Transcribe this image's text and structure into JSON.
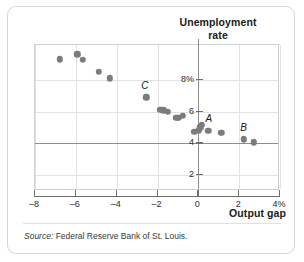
{
  "figure": {
    "source_prefix": "Source:",
    "source_text": " Federal Reserve Bank of St. Louis."
  },
  "chart_data": {
    "type": "scatter",
    "title": "Unemployment rate",
    "title_line1": "Unemployment",
    "title_line2": "rate",
    "xlabel": "Output gap",
    "ylabel": "Unemployment rate",
    "xlim": [
      -8,
      4
    ],
    "ylim": [
      1,
      10.2
    ],
    "xticks": [
      -8,
      -6,
      -4,
      -2,
      0,
      2,
      4
    ],
    "xticklabels": [
      "–8",
      "–6",
      "–4",
      "–2",
      "0",
      "2",
      "4%"
    ],
    "yticks": [
      8,
      6,
      4,
      2
    ],
    "yticklabels": [
      "8%",
      "6",
      "4",
      "2"
    ],
    "grid": true,
    "legend": null,
    "marker_color": "#7c7c7c",
    "points": [
      {
        "x": -6.8,
        "y": 9.3,
        "label": ""
      },
      {
        "x": -5.92,
        "y": 9.62,
        "label": ""
      },
      {
        "x": -5.66,
        "y": 9.26,
        "label": ""
      },
      {
        "x": -4.88,
        "y": 8.52,
        "label": ""
      },
      {
        "x": -4.33,
        "y": 8.1,
        "label": ""
      },
      {
        "x": -2.54,
        "y": 6.9,
        "label": "C"
      },
      {
        "x": -1.86,
        "y": 6.12,
        "label": ""
      },
      {
        "x": -1.72,
        "y": 6.08,
        "label": ""
      },
      {
        "x": -1.5,
        "y": 6.0,
        "label": ""
      },
      {
        "x": -1.08,
        "y": 5.62,
        "label": ""
      },
      {
        "x": -0.98,
        "y": 5.6,
        "label": ""
      },
      {
        "x": -0.76,
        "y": 5.72,
        "label": ""
      },
      {
        "x": -0.2,
        "y": 4.72,
        "label": ""
      },
      {
        "x": 0.02,
        "y": 4.82,
        "label": ""
      },
      {
        "x": 0.1,
        "y": 5.02,
        "label": ""
      },
      {
        "x": 0.18,
        "y": 5.18,
        "label": "A"
      },
      {
        "x": 0.48,
        "y": 4.78,
        "label": ""
      },
      {
        "x": 1.12,
        "y": 4.68,
        "label": ""
      },
      {
        "x": 2.24,
        "y": 4.26,
        "label": "B"
      },
      {
        "x": 2.72,
        "y": 4.06,
        "label": ""
      }
    ],
    "annotations": [
      {
        "text": "C",
        "x": -2.62,
        "y": 7.66
      },
      {
        "text": "A",
        "x": 0.52,
        "y": 5.62
      },
      {
        "text": "B",
        "x": 2.22,
        "y": 5.02
      }
    ]
  }
}
